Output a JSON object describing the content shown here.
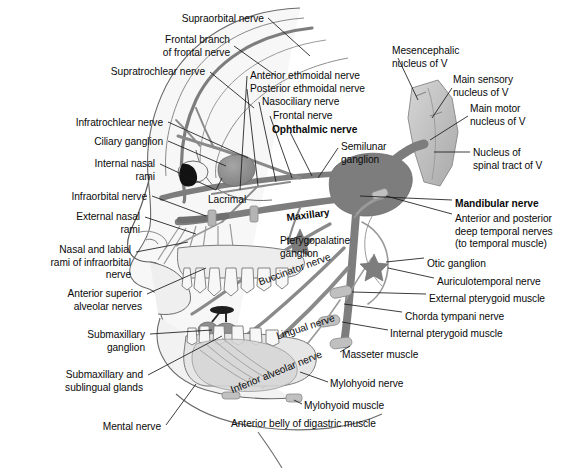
{
  "figure": {
    "background_color": "#ffffff",
    "width": 570,
    "height": 468,
    "line_color": "#4a4a4a",
    "leader_color": "#1a1a1a",
    "text_color": "#0a0a0a"
  },
  "palette": {
    "nerve_trunk": "#7d7d7d",
    "nerve_trunk_dark": "#6b6b6b",
    "ganglion_gray": "#8c8c8c",
    "brainstem": "#c3c3c3",
    "brainstem_shadow": "#a8a8a8",
    "tissue_light": "#efefef",
    "tissue_mid": "#dcdcdc",
    "tissue_dark": "#c8c8c8",
    "tooth": "#f5f5f5",
    "pupil_black": "#111111",
    "outline": "#555555"
  },
  "labels": {
    "left": [
      {
        "id": "supraorbital-nerve",
        "text": "Supraorbital nerve",
        "x": 264,
        "y": 13,
        "align": "right",
        "bold": false
      },
      {
        "id": "frontal-branch-of-frontal-nerve",
        "text": "Frontal branch\nof frontal nerve",
        "x": 230,
        "y": 34,
        "align": "right",
        "bold": false
      },
      {
        "id": "supratrochlear-nerve",
        "text": "Supratrochlear nerve",
        "x": 205,
        "y": 66,
        "align": "right",
        "bold": false
      },
      {
        "id": "infratrochlear-nerve",
        "text": "Infratrochlear nerve",
        "x": 163,
        "y": 117,
        "align": "right",
        "bold": false
      },
      {
        "id": "ciliary-ganglion",
        "text": "Ciliary ganglion",
        "x": 163,
        "y": 136,
        "align": "right",
        "bold": false
      },
      {
        "id": "internal-nasal-rami",
        "text": "Internal nasal\nrami",
        "x": 155,
        "y": 158,
        "align": "right",
        "bold": false
      },
      {
        "id": "infraorbital-nerve",
        "text": "Infraorbital nerve",
        "x": 147,
        "y": 191,
        "align": "right",
        "bold": false
      },
      {
        "id": "external-nasal-rami",
        "text": "External nasal\nrami",
        "x": 140,
        "y": 211,
        "align": "right",
        "bold": false
      },
      {
        "id": "nasal-and-labial-rami-of-infraorbital-nerve",
        "text": "Nasal and labial\nrami of infraorbital\nnerve",
        "x": 131,
        "y": 244,
        "align": "right",
        "bold": false
      },
      {
        "id": "anterior-superior-alveolar-nerves",
        "text": "Anterior superior\nalveolar nerves",
        "x": 142,
        "y": 288,
        "align": "right",
        "bold": false
      },
      {
        "id": "submaxillary-ganglion",
        "text": "Submaxillary\nganglion",
        "x": 145,
        "y": 329,
        "align": "right",
        "bold": false
      },
      {
        "id": "submaxillary-and-sublingual-glands",
        "text": "Submaxillary and\nsublingual glands",
        "x": 143,
        "y": 369,
        "align": "right",
        "bold": false
      },
      {
        "id": "mental-nerve",
        "text": "Mental nerve",
        "x": 161,
        "y": 421,
        "align": "right",
        "bold": false
      }
    ],
    "center": [
      {
        "id": "anterior-ethmoidal-nerve",
        "text": "Anterior ethmoidal nerve",
        "x": 250,
        "y": 70,
        "align": "left",
        "bold": false
      },
      {
        "id": "posterior-ethmoidal-nerve",
        "text": "Posterior ethmoidal nerve",
        "x": 250,
        "y": 83,
        "align": "left",
        "bold": false
      },
      {
        "id": "nasociliary-nerve",
        "text": "Nasociliary nerve",
        "x": 262,
        "y": 96,
        "align": "left",
        "bold": false
      },
      {
        "id": "frontal-nerve",
        "text": "Frontal nerve",
        "x": 273,
        "y": 110,
        "align": "left",
        "bold": false
      },
      {
        "id": "ophthalmic-nerve",
        "text": "Ophthalmic nerve",
        "x": 272,
        "y": 124,
        "align": "left",
        "bold": true
      },
      {
        "id": "semilunar-ganglion",
        "text": "Semilunar\nganglion",
        "x": 341,
        "y": 141,
        "align": "left",
        "bold": false
      },
      {
        "id": "lacrimal",
        "text": "Lacrimal",
        "x": 208,
        "y": 194,
        "align": "left",
        "bold": false
      },
      {
        "id": "pterygopalatine-ganglion",
        "text": "Pterygopalatine\nganglion",
        "x": 280,
        "y": 235,
        "align": "left",
        "bold": false
      },
      {
        "id": "masseter-muscle",
        "text": "Masseter muscle",
        "x": 342,
        "y": 349,
        "align": "left",
        "bold": false
      },
      {
        "id": "mylohyoid-nerve",
        "text": "Mylohyoid nerve",
        "x": 330,
        "y": 378,
        "align": "left",
        "bold": false
      },
      {
        "id": "mylohyoid-muscle",
        "text": "Mylohyoid muscle",
        "x": 304,
        "y": 400,
        "align": "left",
        "bold": false
      },
      {
        "id": "anterior-belly-of-digastric-muscle",
        "text": "Anterior belly of digastric muscle",
        "x": 231,
        "y": 418,
        "align": "left",
        "bold": false
      }
    ],
    "right": [
      {
        "id": "mesencephalic-nucleus-of-v",
        "text": "Mesencephalic\nnucleus of V",
        "x": 392,
        "y": 45,
        "align": "left",
        "bold": false
      },
      {
        "id": "main-sensory-nucleus-of-v",
        "text": "Main sensory\nnucleus of V",
        "x": 453,
        "y": 74,
        "align": "left",
        "bold": false
      },
      {
        "id": "main-motor-nucleus-of-v",
        "text": "Main motor\nnucleus of V",
        "x": 470,
        "y": 103,
        "align": "left",
        "bold": false
      },
      {
        "id": "nucleus-of-spinal-tract-of-v",
        "text": "Nucleus of\nspinal tract of V",
        "x": 473,
        "y": 147,
        "align": "left",
        "bold": false
      },
      {
        "id": "mandibular-nerve",
        "text": "Mandibular nerve",
        "x": 455,
        "y": 198,
        "align": "left",
        "bold": true
      },
      {
        "id": "anterior-and-posterior-deep-temporal-nerves",
        "text": "Anterior and posterior\ndeep temporal nerves\n(to temporal muscle)",
        "x": 455,
        "y": 213,
        "align": "left",
        "bold": false
      },
      {
        "id": "otic-ganglion",
        "text": "Otic ganglion",
        "x": 427,
        "y": 258,
        "align": "left",
        "bold": false
      },
      {
        "id": "auriculotemporal-nerve",
        "text": "Auriculotemporal nerve",
        "x": 437,
        "y": 276,
        "align": "left",
        "bold": false
      },
      {
        "id": "external-pterygoid-muscle",
        "text": "External pterygoid muscle",
        "x": 429,
        "y": 293,
        "align": "left",
        "bold": false
      },
      {
        "id": "chorda-tympani-nerve",
        "text": "Chorda tympani nerve",
        "x": 405,
        "y": 311,
        "align": "left",
        "bold": false
      },
      {
        "id": "internal-pterygoid-muscle",
        "text": "Internal pterygoid muscle",
        "x": 390,
        "y": 328,
        "align": "left",
        "bold": false
      }
    ],
    "rotated": [
      {
        "id": "maxillary",
        "text": "Maxillary",
        "x": 286,
        "y": 212,
        "rotate": -7,
        "bold": true
      },
      {
        "id": "buccinator-nerve",
        "text": "Buccinator nerve",
        "x": 257,
        "y": 277,
        "rotate": -20,
        "bold": false
      },
      {
        "id": "lingual-nerve",
        "text": "Lingual nerve",
        "x": 275,
        "y": 331,
        "rotate": -18,
        "bold": false
      },
      {
        "id": "inferior-alveolar-nerve",
        "text": "Inferior alveolar nerve",
        "x": 229,
        "y": 385,
        "rotate": -22,
        "bold": false
      }
    ]
  }
}
